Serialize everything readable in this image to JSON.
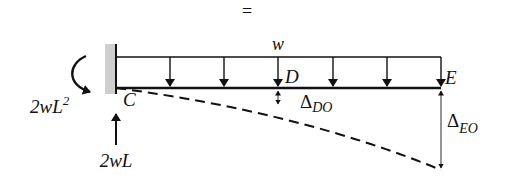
{
  "diagram": {
    "type": "cantilever-beam-deflection",
    "equals_sign": "=",
    "load": {
      "label": "w",
      "type": "uniform-distributed-load",
      "arrow_count": 6
    },
    "points": {
      "fixed_end": "C",
      "mid_point": "D",
      "free_end": "E"
    },
    "support_reactions": {
      "moment": {
        "coef": "2",
        "var": "wL",
        "exp": "2"
      },
      "force": "2wL"
    },
    "deflections": {
      "at_D": {
        "symbol": "Δ",
        "subscript": "DO"
      },
      "at_E": {
        "symbol": "Δ",
        "subscript": "EO"
      }
    },
    "colors": {
      "line": "#111111",
      "wall_hatch": "#c8c8c8"
    }
  }
}
